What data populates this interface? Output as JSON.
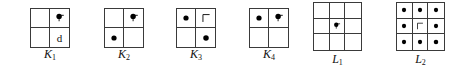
{
  "canvas": {
    "width": 461,
    "height": 68,
    "background": "#ffffff"
  },
  "style": {
    "line_color": "#3a3a3a",
    "ink_color": "#111111",
    "dot_color": "#000000"
  },
  "figures": [
    {
      "id": "K1",
      "caption_base": "K",
      "caption_sub": "1",
      "grid": {
        "rows": 2,
        "cols": 2
      },
      "left": 30,
      "top": 8,
      "size": 40,
      "caption_top": 47,
      "cells": [
        {
          "index": 0,
          "row": 0,
          "col": 0,
          "content": "empty"
        },
        {
          "index": 1,
          "row": 0,
          "col": 1,
          "content": "dot-flag"
        },
        {
          "index": 2,
          "row": 1,
          "col": 0,
          "content": "empty"
        },
        {
          "index": 3,
          "row": 1,
          "col": 1,
          "content": "letter",
          "letter": "d"
        }
      ]
    },
    {
      "id": "K2",
      "caption_base": "K",
      "caption_sub": "2",
      "grid": {
        "rows": 2,
        "cols": 2
      },
      "left": 104,
      "top": 8,
      "size": 40,
      "caption_top": 47,
      "cells": [
        {
          "index": 0,
          "row": 0,
          "col": 0,
          "content": "empty"
        },
        {
          "index": 1,
          "row": 0,
          "col": 1,
          "content": "dot-flag"
        },
        {
          "index": 2,
          "row": 1,
          "col": 0,
          "content": "dot"
        },
        {
          "index": 3,
          "row": 1,
          "col": 1,
          "content": "empty"
        }
      ]
    },
    {
      "id": "K3",
      "caption_base": "K",
      "caption_sub": "3",
      "grid": {
        "rows": 2,
        "cols": 2
      },
      "left": 176,
      "top": 8,
      "size": 40,
      "caption_top": 47,
      "cells": [
        {
          "index": 0,
          "row": 0,
          "col": 0,
          "content": "dot"
        },
        {
          "index": 1,
          "row": 0,
          "col": 1,
          "content": "hook"
        },
        {
          "index": 2,
          "row": 1,
          "col": 0,
          "content": "empty"
        },
        {
          "index": 3,
          "row": 1,
          "col": 1,
          "content": "dot"
        }
      ]
    },
    {
      "id": "K4",
      "caption_base": "K",
      "caption_sub": "4",
      "grid": {
        "rows": 2,
        "cols": 2
      },
      "left": 249,
      "top": 8,
      "size": 40,
      "caption_top": 47,
      "cells": [
        {
          "index": 0,
          "row": 0,
          "col": 0,
          "content": "dot"
        },
        {
          "index": 1,
          "row": 0,
          "col": 1,
          "content": "dot-flag"
        },
        {
          "index": 2,
          "row": 1,
          "col": 0,
          "content": "empty"
        },
        {
          "index": 3,
          "row": 1,
          "col": 1,
          "content": "empty"
        }
      ]
    },
    {
      "id": "L1",
      "caption_base": "L",
      "caption_sub": "1",
      "grid": {
        "rows": 3,
        "cols": 3
      },
      "left": 313,
      "top": 2,
      "size": 49,
      "caption_top": 52,
      "cells": [
        {
          "index": 0,
          "row": 0,
          "col": 0,
          "content": "empty"
        },
        {
          "index": 1,
          "row": 0,
          "col": 1,
          "content": "empty"
        },
        {
          "index": 2,
          "row": 0,
          "col": 2,
          "content": "empty"
        },
        {
          "index": 3,
          "row": 1,
          "col": 0,
          "content": "empty"
        },
        {
          "index": 4,
          "row": 1,
          "col": 1,
          "content": "dot-flag"
        },
        {
          "index": 5,
          "row": 1,
          "col": 2,
          "content": "empty"
        },
        {
          "index": 6,
          "row": 2,
          "col": 0,
          "content": "empty"
        },
        {
          "index": 7,
          "row": 2,
          "col": 1,
          "content": "empty"
        },
        {
          "index": 8,
          "row": 2,
          "col": 2,
          "content": "empty"
        }
      ]
    },
    {
      "id": "L2",
      "caption_base": "L",
      "caption_sub": "2",
      "grid": {
        "rows": 3,
        "cols": 3
      },
      "left": 396,
      "top": 2,
      "size": 49,
      "caption_top": 52,
      "cells": [
        {
          "index": 0,
          "row": 0,
          "col": 0,
          "content": "dot"
        },
        {
          "index": 1,
          "row": 0,
          "col": 1,
          "content": "dot"
        },
        {
          "index": 2,
          "row": 0,
          "col": 2,
          "content": "dot"
        },
        {
          "index": 3,
          "row": 1,
          "col": 0,
          "content": "dot"
        },
        {
          "index": 4,
          "row": 1,
          "col": 1,
          "content": "hook"
        },
        {
          "index": 5,
          "row": 1,
          "col": 2,
          "content": "dot"
        },
        {
          "index": 6,
          "row": 2,
          "col": 0,
          "content": "dot"
        },
        {
          "index": 7,
          "row": 2,
          "col": 1,
          "content": "dot"
        },
        {
          "index": 8,
          "row": 2,
          "col": 2,
          "content": "dot"
        }
      ]
    }
  ]
}
